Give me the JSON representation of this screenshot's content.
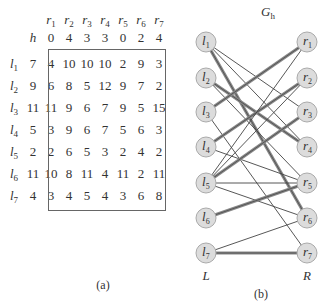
{
  "figure_a": {
    "caption": "(a)",
    "h_label": "h",
    "columns": [
      {
        "name": "r",
        "sub": "1",
        "h": "0"
      },
      {
        "name": "r",
        "sub": "2",
        "h": "4"
      },
      {
        "name": "r",
        "sub": "3",
        "h": "3"
      },
      {
        "name": "r",
        "sub": "4",
        "h": "3"
      },
      {
        "name": "r",
        "sub": "5",
        "h": "0"
      },
      {
        "name": "r",
        "sub": "6",
        "h": "2"
      },
      {
        "name": "r",
        "sub": "7",
        "h": "4"
      }
    ],
    "rows": [
      {
        "name": "l",
        "sub": "1",
        "h": "7",
        "values": [
          "4",
          "10",
          "10",
          "10",
          "2",
          "9",
          "3"
        ]
      },
      {
        "name": "l",
        "sub": "2",
        "h": "9",
        "values": [
          "6",
          "8",
          "5",
          "12",
          "9",
          "7",
          "2"
        ]
      },
      {
        "name": "l",
        "sub": "3",
        "h": "11",
        "values": [
          "11",
          "9",
          "6",
          "7",
          "9",
          "5",
          "15"
        ]
      },
      {
        "name": "l",
        "sub": "4",
        "h": "5",
        "values": [
          "3",
          "9",
          "6",
          "7",
          "5",
          "6",
          "3"
        ]
      },
      {
        "name": "l",
        "sub": "5",
        "h": "2",
        "values": [
          "2",
          "6",
          "5",
          "3",
          "2",
          "4",
          "2"
        ]
      },
      {
        "name": "l",
        "sub": "6",
        "h": "11",
        "values": [
          "10",
          "8",
          "11",
          "4",
          "11",
          "2",
          "11"
        ]
      },
      {
        "name": "l",
        "sub": "7",
        "h": "4",
        "values": [
          "3",
          "4",
          "5",
          "4",
          "3",
          "6",
          "8"
        ]
      }
    ]
  },
  "figure_b": {
    "caption": "(b)",
    "title": "G",
    "title_sub": "h",
    "left_label": "L",
    "right_label": "R",
    "left_nodes": [
      "1",
      "2",
      "3",
      "4",
      "5",
      "6",
      "7"
    ],
    "right_nodes": [
      "1",
      "2",
      "3",
      "4",
      "5",
      "6",
      "7"
    ],
    "edges": [
      {
        "l": 1,
        "r": 3,
        "matched": false
      },
      {
        "l": 1,
        "r": 4,
        "matched": false
      },
      {
        "l": 1,
        "r": 6,
        "matched": true
      },
      {
        "l": 2,
        "r": 4,
        "matched": true
      },
      {
        "l": 2,
        "r": 5,
        "matched": false
      },
      {
        "l": 3,
        "r": 1,
        "matched": true
      },
      {
        "l": 3,
        "r": 7,
        "matched": false
      },
      {
        "l": 4,
        "r": 2,
        "matched": true
      },
      {
        "l": 4,
        "r": 5,
        "matched": false
      },
      {
        "l": 5,
        "r": 1,
        "matched": false
      },
      {
        "l": 5,
        "r": 2,
        "matched": false
      },
      {
        "l": 5,
        "r": 3,
        "matched": true
      },
      {
        "l": 5,
        "r": 5,
        "matched": false
      },
      {
        "l": 5,
        "r": 6,
        "matched": false
      },
      {
        "l": 6,
        "r": 5,
        "matched": true
      },
      {
        "l": 7,
        "r": 6,
        "matched": false
      },
      {
        "l": 7,
        "r": 7,
        "matched": true
      }
    ]
  }
}
